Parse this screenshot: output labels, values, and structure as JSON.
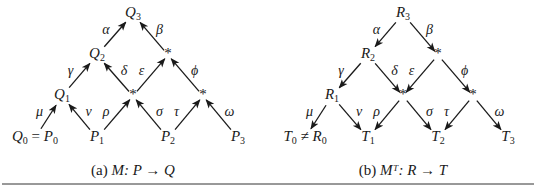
{
  "colors": {
    "ink": "#1a1a1a",
    "rule": "#333333",
    "background": "#ffffff"
  },
  "panels": [
    {
      "id": "a",
      "caption": {
        "prefix": "(a)",
        "text": "M: P → Q",
        "x": 133,
        "y": 172
      },
      "direction": "up",
      "nodes": [
        {
          "id": "n3",
          "label": "Q3",
          "base": "Q",
          "sub": "3",
          "x": 133,
          "y": 14
        },
        {
          "id": "n2",
          "label": "Q2",
          "base": "Q",
          "sub": "2",
          "x": 97,
          "y": 55
        },
        {
          "id": "s2",
          "label": "*",
          "x": 168,
          "y": 55
        },
        {
          "id": "n1",
          "label": "Q1",
          "base": "Q",
          "sub": "1",
          "x": 62,
          "y": 96
        },
        {
          "id": "s1a",
          "label": "*",
          "x": 133,
          "y": 96
        },
        {
          "id": "s1b",
          "label": "*",
          "x": 203,
          "y": 96
        },
        {
          "id": "b0",
          "label": "Q0 = P0",
          "base": "Q",
          "sub": "0",
          "rest": " = ",
          "base2": "P",
          "sub2": "0",
          "x": 35,
          "y": 138
        },
        {
          "id": "b1",
          "label": "P1",
          "base": "P",
          "sub": "1",
          "x": 97,
          "y": 138
        },
        {
          "id": "b2",
          "label": "P2",
          "base": "P",
          "sub": "2",
          "x": 168,
          "y": 138
        },
        {
          "id": "b3",
          "label": "P3",
          "base": "P",
          "sub": "3",
          "x": 238,
          "y": 138
        }
      ],
      "edges": [
        {
          "from": "n2",
          "to": "n3",
          "label": "α",
          "side": "left"
        },
        {
          "from": "s2",
          "to": "n3",
          "label": "β",
          "side": "right"
        },
        {
          "from": "n1",
          "to": "n2",
          "label": "γ",
          "side": "left"
        },
        {
          "from": "s1a",
          "to": "n2",
          "label": "δ",
          "side": "right"
        },
        {
          "from": "s1a",
          "to": "s2",
          "label": "ε",
          "side": "left"
        },
        {
          "from": "s1b",
          "to": "s2",
          "label": "ϕ",
          "side": "right"
        },
        {
          "from": "b0",
          "to": "n1",
          "label": "μ",
          "side": "left"
        },
        {
          "from": "b1",
          "to": "n1",
          "label": "ν",
          "side": "right"
        },
        {
          "from": "b1",
          "to": "s1a",
          "label": "ρ",
          "side": "left"
        },
        {
          "from": "b2",
          "to": "s1a",
          "label": "σ",
          "side": "right"
        },
        {
          "from": "b2",
          "to": "s1b",
          "label": "τ",
          "side": "left"
        },
        {
          "from": "b3",
          "to": "s1b",
          "label": "ω",
          "side": "right"
        }
      ]
    },
    {
      "id": "b",
      "caption": {
        "prefix": "(b)",
        "text": "Mᵀ: R → T",
        "x": 403,
        "y": 172
      },
      "direction": "down",
      "nodes": [
        {
          "id": "n3",
          "label": "R3",
          "base": "R",
          "sub": "3",
          "x": 403,
          "y": 14
        },
        {
          "id": "n2",
          "label": "R2",
          "base": "R",
          "sub": "2",
          "x": 368,
          "y": 55
        },
        {
          "id": "s2",
          "label": "*",
          "x": 438,
          "y": 55
        },
        {
          "id": "n1",
          "label": "R1",
          "base": "R",
          "sub": "1",
          "x": 332,
          "y": 96
        },
        {
          "id": "s1a",
          "label": "*",
          "x": 403,
          "y": 96
        },
        {
          "id": "s1b",
          "label": "*",
          "x": 473,
          "y": 96
        },
        {
          "id": "b0",
          "label": "T0 ≠ R0",
          "base": "T",
          "sub": "0",
          "rest": " ≠ ",
          "base2": "R",
          "sub2": "0",
          "x": 305,
          "y": 138
        },
        {
          "id": "b1",
          "label": "T1",
          "base": "T",
          "sub": "1",
          "x": 368,
          "y": 138
        },
        {
          "id": "b2",
          "label": "T2",
          "base": "T",
          "sub": "2",
          "x": 438,
          "y": 138
        },
        {
          "id": "b3",
          "label": "T3",
          "base": "T",
          "sub": "3",
          "x": 508,
          "y": 138
        }
      ],
      "edges": [
        {
          "from": "n3",
          "to": "n2",
          "label": "α",
          "side": "left"
        },
        {
          "from": "n3",
          "to": "s2",
          "label": "β",
          "side": "right"
        },
        {
          "from": "n2",
          "to": "n1",
          "label": "γ",
          "side": "left"
        },
        {
          "from": "n2",
          "to": "s1a",
          "label": "δ",
          "side": "right"
        },
        {
          "from": "s2",
          "to": "s1a",
          "label": "ε",
          "side": "left"
        },
        {
          "from": "s2",
          "to": "s1b",
          "label": "ϕ",
          "side": "right"
        },
        {
          "from": "n1",
          "to": "b0",
          "label": "μ",
          "side": "left"
        },
        {
          "from": "n1",
          "to": "b1",
          "label": "ν",
          "side": "right"
        },
        {
          "from": "s1a",
          "to": "b1",
          "label": "ρ",
          "side": "left"
        },
        {
          "from": "s1a",
          "to": "b2",
          "label": "σ",
          "side": "right"
        },
        {
          "from": "s1b",
          "to": "b2",
          "label": "τ",
          "side": "left"
        },
        {
          "from": "s1b",
          "to": "b3",
          "label": "ω",
          "side": "right"
        }
      ]
    }
  ],
  "rule": {
    "x1": 2,
    "x2": 534,
    "y": 184
  }
}
